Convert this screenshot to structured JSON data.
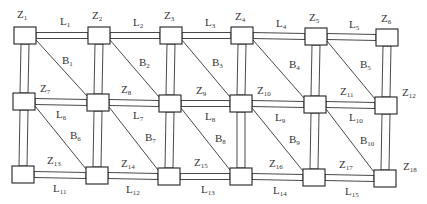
{
  "diagram": {
    "type": "grid-network",
    "stroke_color": "#222222",
    "background": "#ffffff",
    "nodes": [
      {
        "id": "Z1",
        "label": "Z",
        "sub": "1",
        "x": 14,
        "y": 27
      },
      {
        "id": "Z2",
        "label": "Z",
        "sub": "2",
        "x": 88,
        "y": 27
      },
      {
        "id": "Z3",
        "label": "Z",
        "sub": "3",
        "x": 160,
        "y": 27
      },
      {
        "id": "Z4",
        "label": "Z",
        "sub": "4",
        "x": 231,
        "y": 27
      },
      {
        "id": "Z5",
        "label": "Z",
        "sub": "5",
        "x": 305,
        "y": 28
      },
      {
        "id": "Z6",
        "label": "Z",
        "sub": "6",
        "x": 376,
        "y": 29
      },
      {
        "id": "Z7",
        "label": "Z",
        "sub": "7",
        "x": 13,
        "y": 93
      },
      {
        "id": "Z8",
        "label": "Z",
        "sub": "8",
        "x": 87,
        "y": 94
      },
      {
        "id": "Z9",
        "label": "Z",
        "sub": "9",
        "x": 159,
        "y": 95
      },
      {
        "id": "Z10",
        "label": "Z",
        "sub": "10",
        "x": 230,
        "y": 95
      },
      {
        "id": "Z11",
        "label": "Z",
        "sub": "11",
        "x": 304,
        "y": 96
      },
      {
        "id": "Z12",
        "label": "Z",
        "sub": "12",
        "x": 375,
        "y": 97
      },
      {
        "id": "Z13",
        "label": "Z",
        "sub": "13",
        "x": 12,
        "y": 166
      },
      {
        "id": "Z14",
        "label": "Z",
        "sub": "14",
        "x": 86,
        "y": 167
      },
      {
        "id": "Z15",
        "label": "Z",
        "sub": "15",
        "x": 158,
        "y": 168
      },
      {
        "id": "Z16",
        "label": "Z",
        "sub": "16",
        "x": 230,
        "y": 168
      },
      {
        "id": "Z17",
        "label": "Z",
        "sub": "17",
        "x": 303,
        "y": 169
      },
      {
        "id": "Z18",
        "label": "Z",
        "sub": "18",
        "x": 374,
        "y": 170
      }
    ],
    "node_labels": [
      {
        "text": "Z",
        "sub": "1",
        "x": 17,
        "y": 18
      },
      {
        "text": "Z",
        "sub": "2",
        "x": 92,
        "y": 19
      },
      {
        "text": "Z",
        "sub": "3",
        "x": 164,
        "y": 19
      },
      {
        "text": "Z",
        "sub": "4",
        "x": 235,
        "y": 20
      },
      {
        "text": "Z",
        "sub": "5",
        "x": 309,
        "y": 21
      },
      {
        "text": "Z",
        "sub": "6",
        "x": 381,
        "y": 22
      },
      {
        "text": "Z",
        "sub": "7",
        "x": 40,
        "y": 92
      },
      {
        "text": "Z",
        "sub": "8",
        "x": 121,
        "y": 93
      },
      {
        "text": "Z",
        "sub": "9",
        "x": 196,
        "y": 94
      },
      {
        "text": "Z",
        "sub": "10",
        "x": 257,
        "y": 94
      },
      {
        "text": "Z",
        "sub": "11",
        "x": 340,
        "y": 95
      },
      {
        "text": "Z",
        "sub": "12",
        "x": 402,
        "y": 96
      },
      {
        "text": "Z",
        "sub": "13",
        "x": 47,
        "y": 164
      },
      {
        "text": "Z",
        "sub": "14",
        "x": 121,
        "y": 167
      },
      {
        "text": "Z",
        "sub": "15",
        "x": 194,
        "y": 166
      },
      {
        "text": "Z",
        "sub": "16",
        "x": 269,
        "y": 167
      },
      {
        "text": "Z",
        "sub": "17",
        "x": 339,
        "y": 168
      },
      {
        "text": "Z",
        "sub": "18",
        "x": 403,
        "y": 170
      }
    ],
    "horizontal_lines": [
      {
        "id": "L1",
        "text": "L",
        "sub": "1",
        "lx": 60,
        "ly": 25
      },
      {
        "id": "L2",
        "text": "L",
        "sub": "2",
        "lx": 133,
        "ly": 26
      },
      {
        "id": "L3",
        "text": "L",
        "sub": "3",
        "lx": 205,
        "ly": 26
      },
      {
        "id": "L4",
        "text": "L",
        "sub": "4",
        "lx": 276,
        "ly": 27
      },
      {
        "id": "L5",
        "text": "L",
        "sub": "5",
        "lx": 349,
        "ly": 28
      },
      {
        "id": "L6",
        "text": "L",
        "sub": "6",
        "lx": 56,
        "ly": 118
      },
      {
        "id": "L7",
        "text": "L",
        "sub": "7",
        "lx": 133,
        "ly": 119
      },
      {
        "id": "L8",
        "text": "L",
        "sub": "8",
        "lx": 205,
        "ly": 120
      },
      {
        "id": "L9",
        "text": "L",
        "sub": "9",
        "lx": 275,
        "ly": 121
      },
      {
        "id": "L10",
        "text": "L",
        "sub": "10",
        "lx": 349,
        "ly": 121
      },
      {
        "id": "L11",
        "text": "L",
        "sub": "11",
        "lx": 53,
        "ly": 192
      },
      {
        "id": "L12",
        "text": "L",
        "sub": "12",
        "lx": 126,
        "ly": 193
      },
      {
        "id": "L13",
        "text": "L",
        "sub": "13",
        "lx": 201,
        "ly": 193
      },
      {
        "id": "L14",
        "text": "L",
        "sub": "14",
        "lx": 273,
        "ly": 194
      },
      {
        "id": "L15",
        "text": "L",
        "sub": "15",
        "lx": 345,
        "ly": 195
      }
    ],
    "diagonals": [
      {
        "id": "B1",
        "text": "B",
        "sub": "1",
        "lx": 62,
        "ly": 64
      },
      {
        "id": "B2",
        "text": "B",
        "sub": "2",
        "lx": 139,
        "ly": 66
      },
      {
        "id": "B3",
        "text": "B",
        "sub": "3",
        "lx": 212,
        "ly": 66
      },
      {
        "id": "B4",
        "text": "B",
        "sub": "4",
        "lx": 289,
        "ly": 68
      },
      {
        "id": "B5",
        "text": "B",
        "sub": "5",
        "lx": 360,
        "ly": 68
      },
      {
        "id": "B6",
        "text": "B",
        "sub": "6",
        "lx": 70,
        "ly": 139
      },
      {
        "id": "B7",
        "text": "B",
        "sub": "7",
        "lx": 145,
        "ly": 141
      },
      {
        "id": "B8",
        "text": "B",
        "sub": "8",
        "lx": 215,
        "ly": 142
      },
      {
        "id": "B9",
        "text": "B",
        "sub": "9",
        "lx": 289,
        "ly": 143
      },
      {
        "id": "B10",
        "text": "B",
        "sub": "10",
        "lx": 360,
        "ly": 144
      }
    ]
  }
}
